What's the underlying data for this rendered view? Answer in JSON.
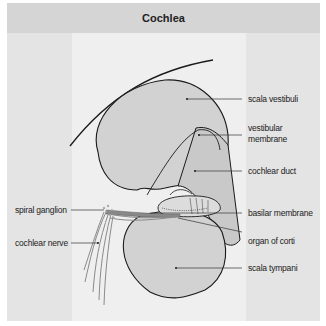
{
  "header": {
    "title": "Cochlea"
  },
  "labels": {
    "scala_vestibuli": "scala vestibuli",
    "vestibular_membrane_1": "vestibular",
    "vestibular_membrane_2": "membrane",
    "cochlear_duct": "cochlear duct",
    "basilar_membrane": "basilar membrane",
    "organ_of_corti": "organ of corti",
    "scala_tympani": "scala tympani",
    "spiral_ganglion": "spiral ganglion",
    "cochlear_nerve": "cochlear nerve"
  },
  "colors": {
    "background": "#e4e4e4",
    "header": "#d5d5d5",
    "light_column": "#efefef",
    "chamber_fill": "#d2d2d2",
    "outline": "#1a1a1a",
    "nerve": "#888888"
  }
}
